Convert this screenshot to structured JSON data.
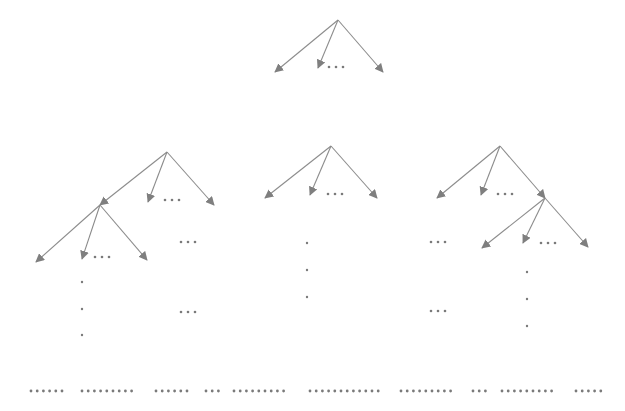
{
  "diagram": {
    "type": "tree-diagram",
    "colors": {
      "edge": "#8c8c8c",
      "dot": "#7a7a7a",
      "background": "#ffffff"
    },
    "trees": [
      {
        "name": "top-tree",
        "root": [
          338,
          20
        ],
        "children": [
          [
            275,
            72
          ],
          [
            318,
            68
          ],
          [
            383,
            72
          ]
        ],
        "ellipsis": [
          [
            329,
            67
          ],
          [
            336,
            67
          ],
          [
            343,
            67
          ]
        ]
      },
      {
        "name": "left-tree",
        "root": [
          167,
          152
        ],
        "children": [
          [
            100,
            205
          ],
          [
            148,
            202
          ],
          [
            214,
            205
          ]
        ],
        "ellipsis": [
          [
            165,
            200
          ],
          [
            172,
            200
          ],
          [
            179,
            200
          ]
        ],
        "subtree": {
          "root": [
            100,
            205
          ],
          "children": [
            [
              36,
              262
            ],
            [
              82,
              259
            ],
            [
              147,
              260
            ]
          ],
          "ellipsis": [
            [
              95,
              257
            ],
            [
              102,
              257
            ],
            [
              109,
              257
            ]
          ]
        },
        "extra_ellipses": [
          [
            [
              181,
              242
            ],
            [
              188,
              242
            ],
            [
              195,
              242
            ]
          ],
          [
            [
              181,
              312
            ],
            [
              188,
              312
            ],
            [
              195,
              312
            ]
          ]
        ],
        "vertical_dots": [
          [
            82,
            282
          ],
          [
            82,
            309
          ],
          [
            82,
            335
          ]
        ]
      },
      {
        "name": "middle-tree",
        "root": [
          331,
          146
        ],
        "children": [
          [
            265,
            198
          ],
          [
            310,
            195
          ],
          [
            377,
            198
          ]
        ],
        "ellipsis": [
          [
            328,
            194
          ],
          [
            335,
            194
          ],
          [
            342,
            194
          ]
        ],
        "vertical_dots": [
          [
            307,
            243
          ],
          [
            307,
            270
          ],
          [
            307,
            297
          ]
        ]
      },
      {
        "name": "right-tree",
        "root": [
          500,
          146
        ],
        "children": [
          [
            437,
            198
          ],
          [
            481,
            195
          ],
          [
            545,
            198
          ]
        ],
        "ellipsis": [
          [
            498,
            194
          ],
          [
            505,
            194
          ],
          [
            512,
            194
          ]
        ],
        "subtree": {
          "root": [
            545,
            198
          ],
          "children": [
            [
              482,
              248
            ],
            [
              523,
              243
            ],
            [
              588,
              247
            ]
          ],
          "ellipsis": [
            [
              541,
              243
            ],
            [
              548,
              243
            ],
            [
              555,
              243
            ]
          ]
        },
        "extra_ellipses": [
          [
            [
              431,
              242
            ],
            [
              438,
              242
            ],
            [
              445,
              242
            ]
          ],
          [
            [
              431,
              311
            ],
            [
              438,
              311
            ],
            [
              445,
              311
            ]
          ]
        ],
        "vertical_dots": [
          [
            527,
            272
          ],
          [
            527,
            299
          ],
          [
            527,
            326
          ]
        ]
      }
    ],
    "bottom_dotted_row": {
      "y": 391,
      "groups": [
        {
          "x_start": 31,
          "count": 6
        },
        {
          "x_start": 82,
          "count": 9
        },
        {
          "x_start": 156,
          "count": 6
        },
        {
          "x_start": 206,
          "count": 3
        },
        {
          "x_start": 234,
          "count": 9
        },
        {
          "x_start": 310,
          "count": 12
        },
        {
          "x_start": 401,
          "count": 9
        },
        {
          "x_start": 473,
          "count": 3
        },
        {
          "x_start": 502,
          "count": 9
        },
        {
          "x_start": 576,
          "count": 5
        }
      ],
      "spacing": 6.2
    }
  }
}
